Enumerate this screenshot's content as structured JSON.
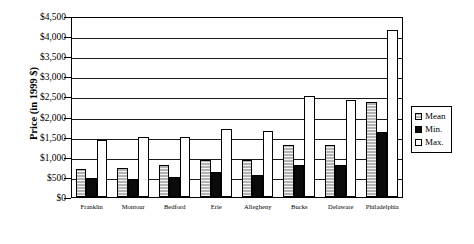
{
  "chart_data": {
    "type": "bar",
    "title": "",
    "xlabel": "",
    "ylabel": "Price (in 1999 $)",
    "ylim": [
      0,
      4500
    ],
    "ytick_step": 500,
    "ytick_labels": [
      "$4,500",
      "$4,000",
      "$3,500",
      "$3,000",
      "$2,500",
      "$2,000",
      "$1,500",
      "$1,000",
      "$500",
      "$0"
    ],
    "ytick_values": [
      4500,
      4000,
      3500,
      3000,
      2500,
      2000,
      1500,
      1000,
      500,
      0
    ],
    "grid": true,
    "grid_axis": "y",
    "legend_position": "right",
    "categories": [
      "Franklin",
      "Montour",
      "Bedford",
      "Erie",
      "Allegheny",
      "Bucks",
      "Delaware",
      "Philadelphia"
    ],
    "series": [
      {
        "name": "Mean",
        "color": "#b3b3b3",
        "pattern": "horizontal-hatch",
        "values": [
          700,
          720,
          790,
          920,
          930,
          1290,
          1290,
          2370
        ]
      },
      {
        "name": "Min.",
        "color": "#0a0a0a",
        "pattern": "solid",
        "values": [
          470,
          450,
          500,
          610,
          540,
          790,
          800,
          1620
        ]
      },
      {
        "name": "Max.",
        "color": "#ffffff",
        "pattern": "open",
        "values": [
          1420,
          1490,
          1480,
          1700,
          1650,
          2520,
          2400,
          4150
        ]
      }
    ]
  },
  "legend": {
    "entries": [
      {
        "label": "Mean"
      },
      {
        "label": "Min."
      },
      {
        "label": "Max."
      }
    ]
  }
}
